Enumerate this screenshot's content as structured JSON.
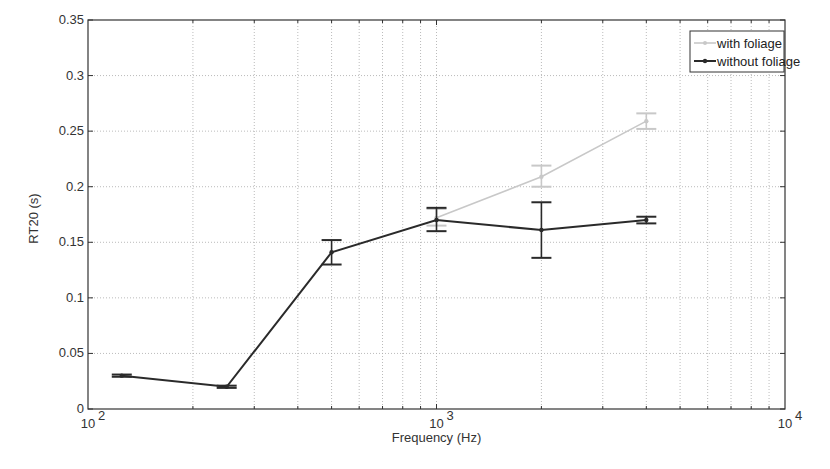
{
  "chart_data": {
    "type": "line",
    "title": "",
    "xlabel": "Frequency (Hz)",
    "ylabel": "RT20 (s)",
    "xscale": "log",
    "xlim": [
      100,
      10000
    ],
    "ylim": [
      0,
      0.35
    ],
    "grid": true,
    "legend_position": "upper right",
    "x_ticks": [
      {
        "value": 100,
        "base": "10",
        "exp": "2"
      },
      {
        "value": 1000,
        "base": "10",
        "exp": "3"
      },
      {
        "value": 10000,
        "base": "10",
        "exp": "4"
      }
    ],
    "y_ticks": [
      "0",
      "0.05",
      "0.1",
      "0.15",
      "0.2",
      "0.25",
      "0.3",
      "0.35"
    ],
    "series": [
      {
        "name": "with foliage",
        "color": "#c8c8c8",
        "x": [
          1000,
          2000,
          4000
        ],
        "values": [
          0.172,
          0.209,
          0.259
        ],
        "err_low": [
          0.165,
          0.2,
          0.252
        ],
        "err_high": [
          0.18,
          0.219,
          0.266
        ]
      },
      {
        "name": "without foliage",
        "color": "#2a2a2a",
        "x": [
          125,
          250,
          500,
          1000,
          2000,
          4000
        ],
        "values": [
          0.03,
          0.02,
          0.141,
          0.17,
          0.161,
          0.17
        ],
        "err_low": [
          0.029,
          0.019,
          0.13,
          0.16,
          0.136,
          0.167
        ],
        "err_high": [
          0.031,
          0.021,
          0.152,
          0.181,
          0.186,
          0.173
        ]
      }
    ]
  }
}
